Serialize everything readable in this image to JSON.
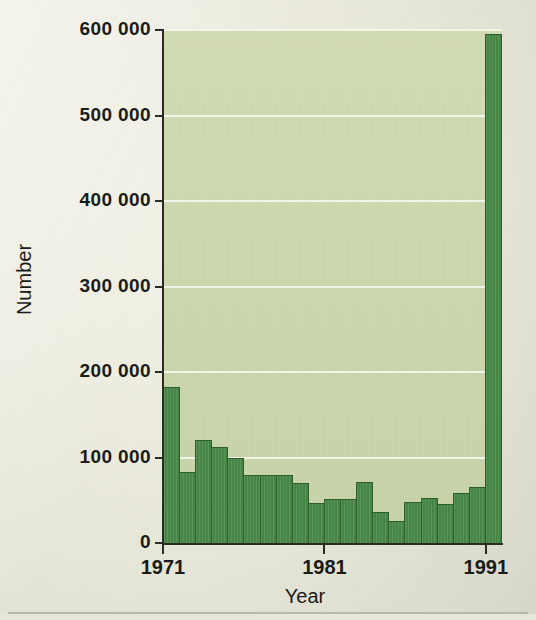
{
  "chart_data": {
    "type": "bar",
    "title": "",
    "xlabel": "Year",
    "ylabel": "Number",
    "categories": [
      "1971",
      "1972",
      "1973",
      "1974",
      "1975",
      "1976",
      "1977",
      "1978",
      "1979",
      "1980",
      "1981",
      "1982",
      "1983",
      "1984",
      "1985",
      "1986",
      "1987",
      "1988",
      "1989",
      "1990",
      "1991"
    ],
    "values": [
      182000,
      83000,
      120000,
      112000,
      100000,
      80000,
      79000,
      79000,
      70000,
      47000,
      52000,
      51000,
      71000,
      36000,
      26000,
      48000,
      53000,
      46000,
      59000,
      66000,
      595000
    ],
    "ylim": [
      0,
      600000
    ],
    "xlim_labels": [
      "1971",
      "1981",
      "1991"
    ],
    "y_ticks": [
      0,
      100000,
      200000,
      300000,
      400000,
      500000,
      600000
    ],
    "y_tick_labels": [
      "0",
      "100 000",
      "200 000",
      "300 000",
      "400 000",
      "500 000",
      "600 000"
    ],
    "x_ticks_shown": [
      "1971",
      "1981",
      "1991"
    ],
    "grid": "horizontal",
    "legend": "none",
    "colors": {
      "bar_fill": "#4b8c4b",
      "bar_stroke": "#2d5c2d",
      "plot_background": "#ccd7ac",
      "gridline": "#f4f6ec",
      "page_background": "#e9e9dd",
      "axis": "#2b2b26",
      "text": "#1b1b18"
    }
  }
}
